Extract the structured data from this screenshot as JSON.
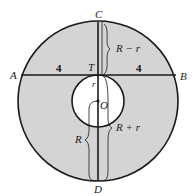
{
  "diagram": {
    "colors": {
      "ring_fill": "#d4d4d4",
      "stroke": "#1a1a1a",
      "inner_fill": "#ffffff"
    },
    "geometry": {
      "center": [
        98,
        101
      ],
      "outer_radius": 80,
      "inner_radius": 26,
      "chord_y": 75
    },
    "labels": {
      "A": "A",
      "B": "B",
      "C": "C",
      "D": "D",
      "T": "T",
      "O": "O",
      "r": "r",
      "R": "R",
      "left_segment": "4",
      "right_segment": "4",
      "r_minus_r": "R − r",
      "r_plus_r": "R + r"
    }
  }
}
